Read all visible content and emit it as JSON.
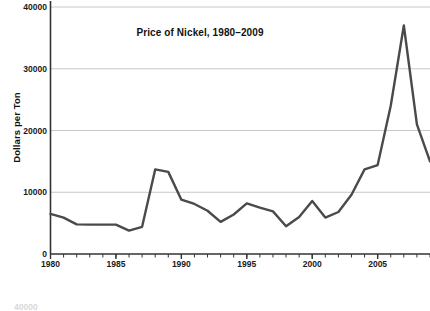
{
  "chart_data": {
    "type": "line",
    "title": "Price of Nickel, 1980–2009",
    "xlabel": "",
    "ylabel": "Dollars per Ton",
    "xlim": [
      1980,
      2009
    ],
    "ylim": [
      0,
      40000
    ],
    "grid": true,
    "legend": "none",
    "line_color": "#4a4a4a",
    "gridline_color": "#c8c8c8",
    "axis_color": "#333333",
    "y_ticks": [
      0,
      10000,
      20000,
      30000,
      40000
    ],
    "y_tick_labels": [
      "0",
      "10000",
      "20000",
      "30000",
      "40000"
    ],
    "x_ticks": [
      1980,
      1985,
      1990,
      1995,
      2000,
      2005
    ],
    "x_tick_labels": [
      "1980",
      "1985",
      "1990",
      "1995",
      "2000",
      "2005"
    ],
    "x_minor_tick_step": 1,
    "x": [
      1980,
      1981,
      1982,
      1983,
      1984,
      1985,
      1986,
      1987,
      1988,
      1989,
      1990,
      1991,
      1992,
      1993,
      1994,
      1995,
      1996,
      1997,
      1998,
      1999,
      2000,
      2001,
      2002,
      2003,
      2004,
      2005,
      2006,
      2007,
      2008,
      2009
    ],
    "values": [
      6500,
      5900,
      4800,
      4750,
      4750,
      4750,
      3800,
      4400,
      13700,
      13300,
      8800,
      8100,
      7000,
      5200,
      6400,
      8200,
      7500,
      6900,
      4500,
      6000,
      8600,
      5900,
      6800,
      9600,
      13700,
      14400,
      24000,
      37000,
      21000,
      15000
    ],
    "annotations": []
  },
  "bottom_cutoff": {
    "text": "40000"
  }
}
